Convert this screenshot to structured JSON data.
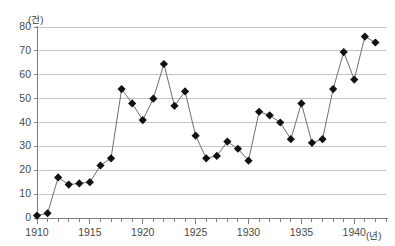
{
  "chart_data": {
    "type": "line",
    "title": "",
    "xlabel": "(년)",
    "ylabel": "(건)",
    "xlim": [
      1910,
      1943
    ],
    "ylim": [
      0,
      80
    ],
    "grid": true,
    "legend": "none",
    "marker": "diamond",
    "y_ticks": [
      0,
      10,
      20,
      30,
      40,
      50,
      60,
      70,
      80
    ],
    "x_ticks": [
      1910,
      1915,
      1920,
      1925,
      1930,
      1935,
      1940
    ],
    "x_tick_labels": [
      "1910",
      "1915",
      "1920",
      "1925",
      "1930",
      "1935",
      "1940"
    ],
    "y_tick_labels": [
      "0",
      "10",
      "20",
      "30",
      "40",
      "50",
      "60",
      "70",
      "80"
    ],
    "x": [
      1910,
      1911,
      1912,
      1913,
      1914,
      1915,
      1916,
      1917,
      1918,
      1919,
      1920,
      1921,
      1922,
      1923,
      1924,
      1925,
      1926,
      1927,
      1928,
      1929,
      1930,
      1931,
      1932,
      1933,
      1934,
      1935,
      1936,
      1937,
      1938,
      1939,
      1940,
      1941,
      1942
    ],
    "values": [
      1,
      2,
      17,
      14,
      14.5,
      15,
      22,
      25,
      54,
      48,
      41,
      50,
      64.5,
      47,
      53,
      34.5,
      25,
      26,
      32,
      29,
      24,
      44.5,
      43,
      40,
      33,
      48,
      31.5,
      33,
      54,
      69.5,
      58,
      76,
      73.5
    ],
    "series_color": "#2b2b2b",
    "grid_color": "#bfbfbf",
    "axis_color": "#8a8a8a"
  },
  "colors": {
    "background": "#ffffff",
    "line": "#6e6e6e",
    "marker": "#111111",
    "grid": "#c4c4c4",
    "axis": "#7f7f7f",
    "tick_text": "#4a4a4a"
  }
}
